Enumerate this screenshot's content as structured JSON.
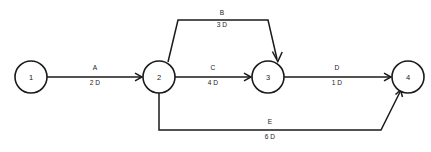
{
  "diagram": {
    "kind": "activity-on-arrow-network",
    "background_color": "#ffffff",
    "line_color": "#1a1a1a",
    "duration_unit_suffix": "D",
    "nodes": [
      {
        "id": "1",
        "label": "1",
        "cx": 31,
        "cy": 77,
        "r": 16
      },
      {
        "id": "2",
        "label": "2",
        "cx": 159,
        "cy": 77,
        "r": 16
      },
      {
        "id": "3",
        "label": "3",
        "cx": 268,
        "cy": 77,
        "r": 16
      },
      {
        "id": "4",
        "label": "4",
        "cx": 408,
        "cy": 77,
        "r": 16
      }
    ],
    "activities": [
      {
        "id": "A",
        "name": "A",
        "duration": "2 D",
        "from": "1",
        "to": "2",
        "path": "M 47 77 L 141 77",
        "arrow": "M 135 73.2 L 142 77 L 135 80.8",
        "name_x": 95,
        "name_y": 70,
        "duration_x": 95,
        "duration_y": 85
      },
      {
        "id": "B",
        "name": "B",
        "duration": "3 D",
        "from": "2",
        "to": "3",
        "path": "M 168 62 L 178 20 L 268 20 L 277 59",
        "arrow": "M 272.4 51.5 L 277.8 61.5 L 282.2 52",
        "name_x": 222,
        "name_y": 15,
        "duration_x": 222,
        "duration_y": 27
      },
      {
        "id": "C",
        "name": "C",
        "duration": "4 D",
        "from": "2",
        "to": "3",
        "path": "M 175 77 L 250 77",
        "arrow": "M 244 73.2 L 251 77 L 244 80.8",
        "name_x": 213,
        "name_y": 70,
        "duration_x": 213,
        "duration_y": 85
      },
      {
        "id": "D",
        "name": "D",
        "duration": "1 D",
        "from": "3",
        "to": "4",
        "path": "M 284 77 L 390 77",
        "arrow": "M 384 73.2 L 391 77 L 384 80.8",
        "name_x": 337,
        "name_y": 70,
        "duration_x": 337,
        "duration_y": 85
      },
      {
        "id": "E",
        "name": "E",
        "duration": "6 D",
        "from": "2",
        "to": "4",
        "path": "M 159 93 L 159 130 L 381 130 L 400 92",
        "arrow": "M 395.5 94.5 L 400.5 90 L 402.5 97",
        "name_x": 270,
        "name_y": 124,
        "duration_x": 270,
        "duration_y": 139
      }
    ]
  }
}
